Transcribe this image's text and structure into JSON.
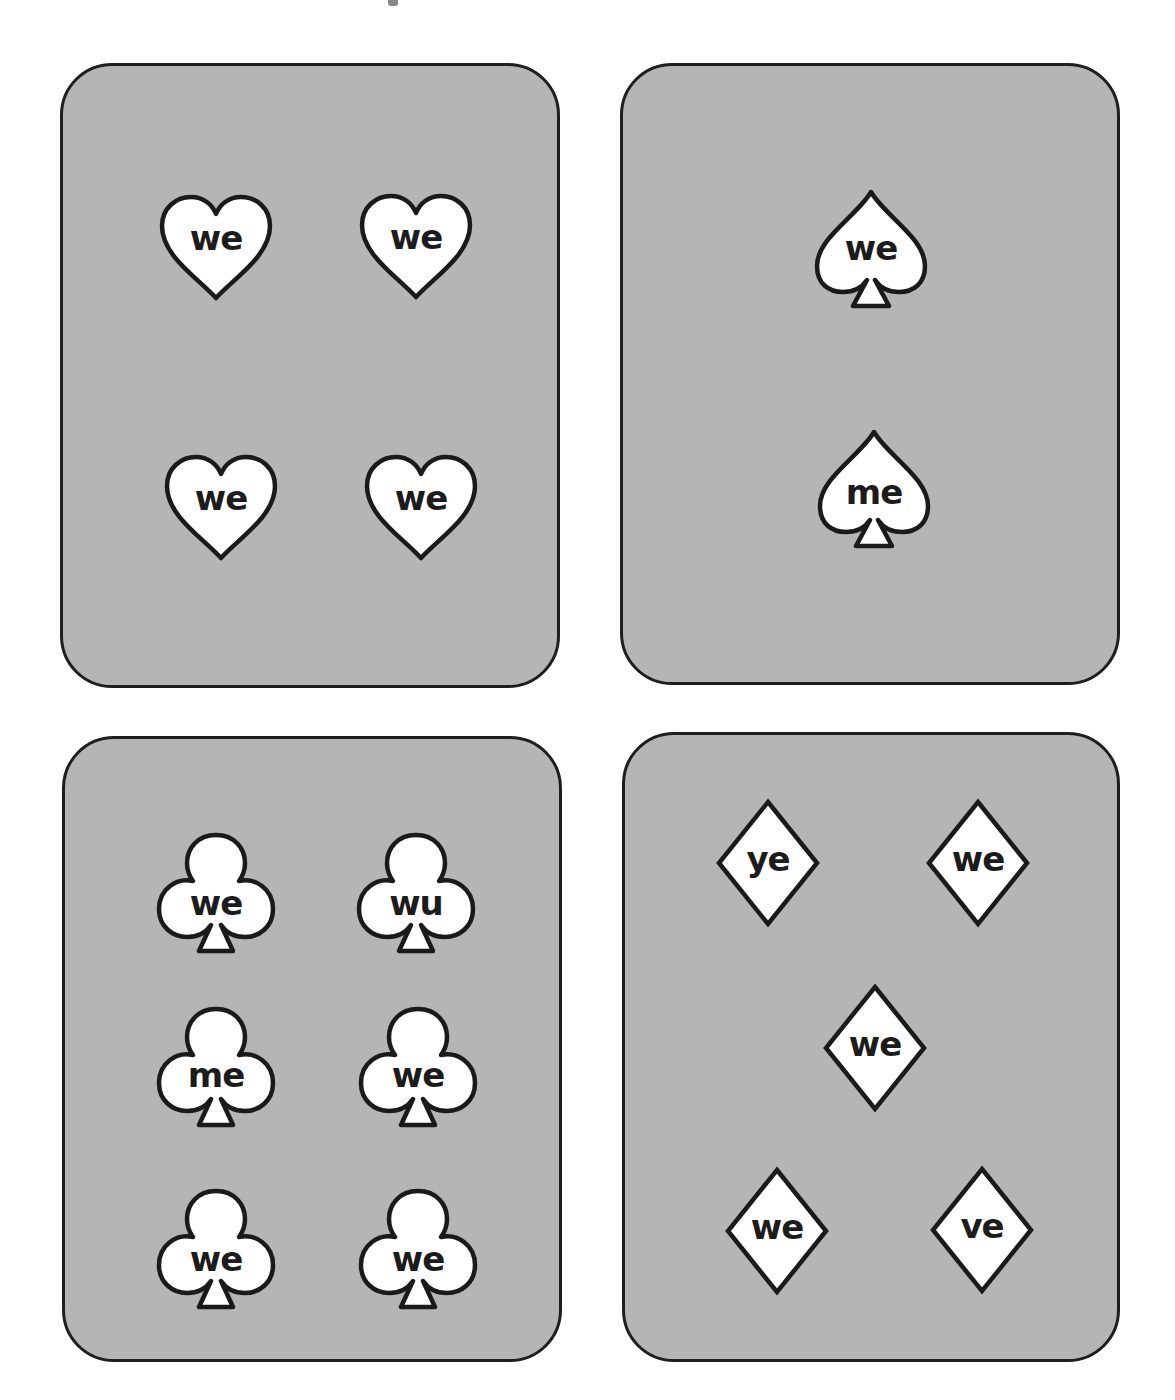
{
  "cards": [
    {
      "id": "hearts",
      "suit": "heart",
      "words": [
        "we",
        "we",
        "we",
        "we"
      ]
    },
    {
      "id": "spades",
      "suit": "spade",
      "words": [
        "we",
        "me"
      ]
    },
    {
      "id": "clubs",
      "suit": "club",
      "words": [
        "we",
        "wu",
        "me",
        "we",
        "we",
        "we"
      ]
    },
    {
      "id": "diamonds",
      "suit": "diamond",
      "words": [
        "ye",
        "we",
        "we",
        "we",
        "ve"
      ]
    }
  ],
  "colors": {
    "card_fill": "#b5b5b5",
    "card_border": "#1e1e1e",
    "symbol_fill": "#ffffff",
    "text": "#1c1c1c"
  }
}
